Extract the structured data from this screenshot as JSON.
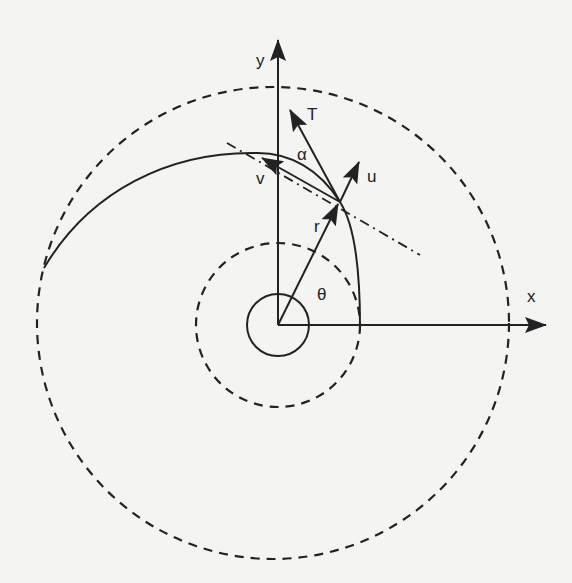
{
  "diagram": {
    "colors": {
      "stroke": "#222222",
      "background": "#f4f4f2"
    },
    "labels": {
      "y_axis": "y",
      "x_axis": "x",
      "thrust": "T",
      "alpha": "α",
      "velocity": "v",
      "unit_vector": "u",
      "radius": "r",
      "theta": "θ"
    },
    "elements": [
      {
        "name": "outer-orbit",
        "type": "dashed-circle"
      },
      {
        "name": "inner-orbit",
        "type": "dashed-circle"
      },
      {
        "name": "central-body",
        "type": "circle"
      },
      {
        "name": "transfer-spiral",
        "type": "curve"
      },
      {
        "name": "tangent-line",
        "type": "dash-dot-line"
      }
    ]
  }
}
